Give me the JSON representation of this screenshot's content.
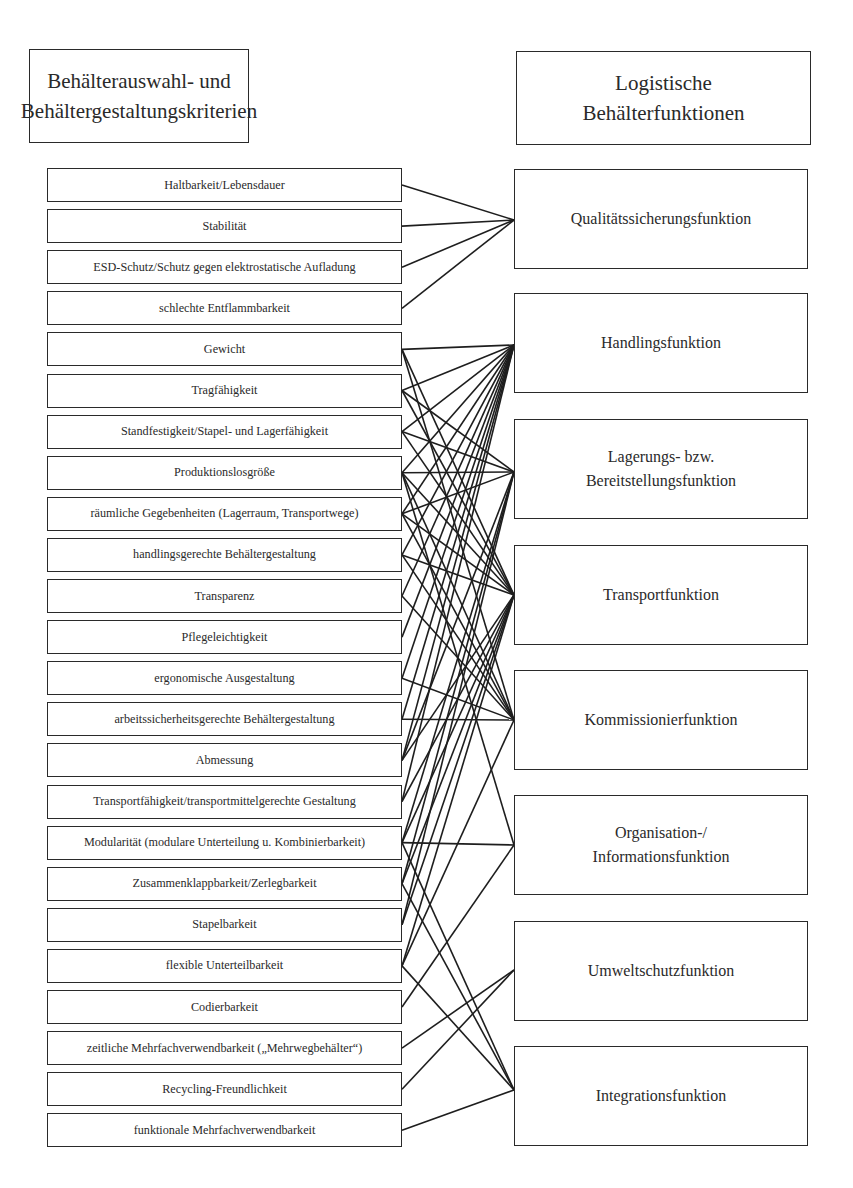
{
  "headers": {
    "left": "Behälterauswahl- und\nBehältergestaltungskriterien",
    "left_line1": "Behälterauswahl- und",
    "left_line2": "Behältergestaltungskriterien",
    "right_line1": "Logistische",
    "right_line2": "Behälterfunktionen"
  },
  "criteria": [
    "Haltbarkeit/Lebensdauer",
    "Stabilität",
    "ESD-Schutz/Schutz gegen elektrostatische Aufladung",
    "schlechte Entflammbarkeit",
    "Gewicht",
    "Tragfähigkeit",
    "Standfestigkeit/Stapel- und Lagerfähigkeit",
    "Produktionslosgröße",
    "räumliche Gegebenheiten (Lagerraum, Transportwege)",
    "handlingsgerechte Behältergestaltung",
    "Transparenz",
    "Pflegeleichtigkeit",
    "ergonomische Ausgestaltung",
    "arbeitssicherheitsgerechte Behältergestaltung",
    "Abmessung",
    "Transportfähigkeit/transportmittelgerechte Gestaltung",
    "Modularität (modulare Unterteilung u. Kombinierbarkeit)",
    "Zusammenklappbarkeit/Zerlegbarkeit",
    "Stapelbarkeit",
    "flexible Unterteilbarkeit",
    "Codierbarkeit",
    "zeitliche Mehrfachverwendbarkeit („Mehrwegbehälter“)",
    "Recycling-Freundlichkeit",
    "funktionale Mehrfachverwendbarkeit"
  ],
  "functions": [
    "Qualitätssicherungsfunktion",
    "Handlingsfunktion",
    "Lagerungs- bzw.\nBereitstellungsfunktion",
    "Transportfunktion",
    "Kommissionierfunktion",
    "Organisation-/\nInformationsfunktion",
    "Umweltschutzfunktion",
    "Integrationsfunktion"
  ],
  "connections": [
    [
      0,
      0
    ],
    [
      1,
      0
    ],
    [
      2,
      0
    ],
    [
      3,
      0
    ],
    [
      4,
      1
    ],
    [
      4,
      3
    ],
    [
      4,
      4
    ],
    [
      5,
      1
    ],
    [
      5,
      2
    ],
    [
      5,
      3
    ],
    [
      6,
      1
    ],
    [
      6,
      2
    ],
    [
      6,
      3
    ],
    [
      7,
      1
    ],
    [
      7,
      2
    ],
    [
      7,
      3
    ],
    [
      7,
      4
    ],
    [
      7,
      5
    ],
    [
      8,
      1
    ],
    [
      8,
      2
    ],
    [
      8,
      3
    ],
    [
      8,
      4
    ],
    [
      9,
      1
    ],
    [
      9,
      3
    ],
    [
      9,
      4
    ],
    [
      10,
      1
    ],
    [
      10,
      4
    ],
    [
      11,
      1
    ],
    [
      12,
      1
    ],
    [
      12,
      4
    ],
    [
      13,
      1
    ],
    [
      13,
      4
    ],
    [
      14,
      1
    ],
    [
      14,
      2
    ],
    [
      14,
      3
    ],
    [
      15,
      1
    ],
    [
      15,
      3
    ],
    [
      16,
      2
    ],
    [
      16,
      3
    ],
    [
      16,
      5
    ],
    [
      16,
      7
    ],
    [
      17,
      2
    ],
    [
      17,
      3
    ],
    [
      17,
      7
    ],
    [
      18,
      2
    ],
    [
      18,
      3
    ],
    [
      19,
      3
    ],
    [
      19,
      4
    ],
    [
      19,
      7
    ],
    [
      20,
      5
    ],
    [
      21,
      6
    ],
    [
      22,
      6
    ],
    [
      23,
      7
    ]
  ]
}
